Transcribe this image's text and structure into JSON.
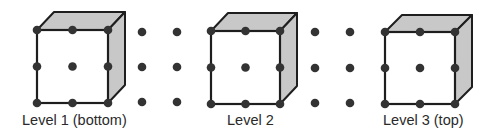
{
  "colors": {
    "background": "#ffffff",
    "edge": "#1e1e1e",
    "dot": "#333333",
    "face_shade": "#c8c8c8"
  },
  "levels": [
    {
      "label": "Level 1 (bottom)",
      "label_x": 22,
      "front": {
        "left": 37,
        "top": 30,
        "right": 108,
        "bottom": 103
      },
      "back_offset": {
        "dx": 17,
        "dy": -18
      }
    },
    {
      "label": "Level 2",
      "label_x": 227,
      "front": {
        "left": 211,
        "top": 31,
        "right": 280,
        "bottom": 104
      },
      "back_offset": {
        "dx": 17,
        "dy": -18
      }
    },
    {
      "label": "Level 3 (top)",
      "label_x": 383,
      "front": {
        "left": 385,
        "top": 32,
        "right": 455,
        "bottom": 104
      },
      "back_offset": {
        "dx": 17,
        "dy": -17
      }
    }
  ],
  "loose_dot_columns": [
    {
      "x": 142,
      "ys": [
        32,
        67,
        102
      ]
    },
    {
      "x": 177,
      "ys": [
        32,
        67,
        102
      ]
    },
    {
      "x": 315,
      "ys": [
        32,
        68,
        103
      ]
    },
    {
      "x": 350,
      "ys": [
        32,
        68,
        103
      ]
    }
  ]
}
